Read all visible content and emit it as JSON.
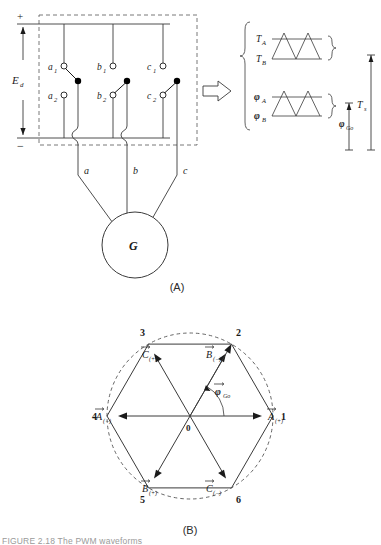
{
  "figure": {
    "panel_a_caption": "(A)",
    "panel_b_caption": "(B)",
    "bottom_caption": "FIGURE 2.18   The PWM waveforms"
  },
  "panel_a": {
    "supply": {
      "plus_sign": "+",
      "minus_sign": "−",
      "voltage_label": "E",
      "voltage_sub": "d"
    },
    "switches": [
      {
        "id": "a1",
        "label": "a",
        "sub": "1",
        "state": "open"
      },
      {
        "id": "b1",
        "label": "b",
        "sub": "1",
        "state": "open"
      },
      {
        "id": "c1",
        "label": "c",
        "sub": "1",
        "state": "open"
      },
      {
        "id": "a2",
        "label": "a",
        "sub": "2",
        "state": "open"
      },
      {
        "id": "b2",
        "label": "b",
        "sub": "2",
        "state": "closed"
      },
      {
        "id": "c2",
        "label": "c",
        "sub": "2",
        "state": "closed"
      }
    ],
    "phase_lines": [
      {
        "label": "a"
      },
      {
        "label": "b"
      },
      {
        "label": "c"
      }
    ],
    "generator_label": "G",
    "arrow_name": "pointer-arrow"
  },
  "panel_a_waveforms": {
    "group_top": [
      {
        "label": "T",
        "sub": "A"
      },
      {
        "label": "T",
        "sub": "B"
      }
    ],
    "group_bottom": [
      {
        "label": "φ",
        "sub": "A"
      },
      {
        "label": "φ",
        "sub": "B"
      }
    ],
    "dimension_small": {
      "label": "φ",
      "sub": "Go"
    },
    "dimension_large": {
      "label": "T",
      "sub": "s"
    }
  },
  "panel_b": {
    "vertices": [
      {
        "number": "1",
        "angle_deg": 0
      },
      {
        "number": "2",
        "angle_deg": 60
      },
      {
        "number": "3",
        "angle_deg": 120
      },
      {
        "number": "4",
        "angle_deg": 180
      },
      {
        "number": "5",
        "angle_deg": 240
      },
      {
        "number": "6",
        "angle_deg": 300
      }
    ],
    "origin_label": "0",
    "vectors": [
      {
        "name": "A-plus",
        "label": "A",
        "sub": "(+)",
        "angle_deg": 0
      },
      {
        "name": "B-minus",
        "label": "B",
        "sub": "(−)",
        "angle_deg": 60
      },
      {
        "name": "C-plus",
        "label": "C",
        "sub": "(+)",
        "angle_deg": 120
      },
      {
        "name": "A-minus",
        "label": "A",
        "sub": "(−)",
        "angle_deg": 180
      },
      {
        "name": "B-plus",
        "label": "B",
        "sub": "(+)",
        "angle_deg": 240
      },
      {
        "name": "C-minus",
        "label": "C",
        "sub": "(−)",
        "angle_deg": 300
      }
    ],
    "resultant": {
      "label": "φ",
      "sub": "Go",
      "angle_deg": 60
    },
    "circle_style": "dashed"
  },
  "colors": {
    "line": "#3a3a3a",
    "dashed": "#555555",
    "text": "#1a1a1a",
    "fill_node": "#000000",
    "background": "#ffffff"
  }
}
